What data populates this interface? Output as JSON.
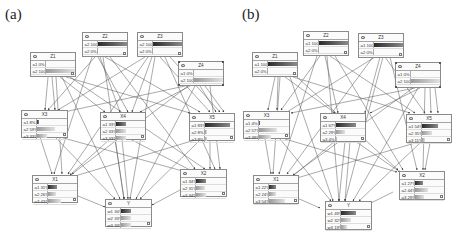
{
  "panels": [
    {
      "label": "(a)",
      "nodes": {
        "Z1": {
          "title": "Z1",
          "states": [
            {
              "label": "a1",
              "value": "0%",
              "pct": 0
            },
            {
              "label": "a2",
              "value": "100%",
              "pct": 100
            }
          ]
        },
        "Z2": {
          "title": "Z2",
          "states": [
            {
              "label": "a2",
              "value": "100%",
              "pct": 100
            },
            {
              "label": "a2",
              "value": "0%",
              "pct": 0
            }
          ]
        },
        "Z3": {
          "title": "Z3",
          "states": [
            {
              "label": "a2",
              "value": "100%",
              "pct": 100
            },
            {
              "label": "a2",
              "value": "0%",
              "pct": 0
            }
          ]
        },
        "Z4": {
          "title": "Z4",
          "states": [
            {
              "label": "a1",
              "value": "0%",
              "pct": 0
            },
            {
              "label": "a2",
              "value": "100%",
              "pct": 100
            }
          ]
        },
        "X3": {
          "title": "X3",
          "states": [
            {
              "label": "a1",
              "value": "8%",
              "pct": 8
            },
            {
              "label": "a2",
              "value": "59%",
              "pct": 59
            },
            {
              "label": "a3",
              "value": "33%",
              "pct": 33
            }
          ]
        },
        "X4": {
          "title": "X4",
          "states": [
            {
              "label": "a1",
              "value": "33%",
              "pct": 33
            },
            {
              "label": "a2",
              "value": "33%",
              "pct": 33
            },
            {
              "label": "a3",
              "value": "33%",
              "pct": 33
            }
          ]
        },
        "X5": {
          "title": "X5",
          "states": [
            {
              "label": "a1",
              "value": "83%",
              "pct": 83
            },
            {
              "label": "a2",
              "value": "8%",
              "pct": 8
            },
            {
              "label": "a3",
              "value": "8%",
              "pct": 8
            }
          ]
        },
        "X1": {
          "title": "X1",
          "states": [
            {
              "label": "a1",
              "value": "31%",
              "pct": 31
            },
            {
              "label": "a2",
              "value": "26%",
              "pct": 26
            },
            {
              "label": "a3",
              "value": "43%",
              "pct": 43
            }
          ]
        },
        "X2": {
          "title": "X2",
          "states": [
            {
              "label": "a1",
              "value": "34%",
              "pct": 34
            },
            {
              "label": "a2",
              "value": "31%",
              "pct": 31
            },
            {
              "label": "a3",
              "value": "34%",
              "pct": 34
            }
          ]
        },
        "Y": {
          "title": "Y",
          "states": [
            {
              "label": "w1",
              "value": "34%",
              "pct": 34
            },
            {
              "label": "w2",
              "value": "33%",
              "pct": 33
            },
            {
              "label": "w3",
              "value": "33%",
              "pct": 33
            }
          ]
        }
      }
    },
    {
      "label": "(b)",
      "nodes": {
        "Z1": {
          "title": "Z1",
          "states": [
            {
              "label": "a1",
              "value": "100%",
              "pct": 100
            },
            {
              "label": "a2",
              "value": "0%",
              "pct": 0
            }
          ]
        },
        "Z2": {
          "title": "Z2",
          "states": [
            {
              "label": "a1",
              "value": "100%",
              "pct": 100
            },
            {
              "label": "a2",
              "value": "0%",
              "pct": 0
            }
          ]
        },
        "Z3": {
          "title": "Z3",
          "states": [
            {
              "label": "a1",
              "value": "100%",
              "pct": 100
            },
            {
              "label": "a2",
              "value": "0%",
              "pct": 0
            }
          ]
        },
        "Z4": {
          "title": "Z4",
          "states": [
            {
              "label": "a1",
              "value": "0%",
              "pct": 0
            },
            {
              "label": "a2",
              "value": "100%",
              "pct": 100
            }
          ]
        },
        "X3": {
          "title": "X3",
          "states": [
            {
              "label": "a1",
              "value": "4%",
              "pct": 4
            },
            {
              "label": "a2",
              "value": "57%",
              "pct": 57
            },
            {
              "label": "a3",
              "value": "39%",
              "pct": 39
            }
          ]
        },
        "X4": {
          "title": "X4",
          "states": [
            {
              "label": "a1",
              "value": "67%",
              "pct": 67
            },
            {
              "label": "a2",
              "value": "29%",
              "pct": 29
            },
            {
              "label": "a3",
              "value": "4%",
              "pct": 4
            }
          ]
        },
        "X5": {
          "title": "X5",
          "states": [
            {
              "label": "a1",
              "value": "54%",
              "pct": 54
            },
            {
              "label": "a2",
              "value": "35%",
              "pct": 35
            },
            {
              "label": "a3",
              "value": "11%",
              "pct": 11
            }
          ]
        },
        "X1": {
          "title": "X1",
          "states": [
            {
              "label": "a1",
              "value": "22%",
              "pct": 22
            },
            {
              "label": "a2",
              "value": "24%",
              "pct": 24
            },
            {
              "label": "a3",
              "value": "54%",
              "pct": 54
            }
          ]
        },
        "X2": {
          "title": "X2",
          "states": [
            {
              "label": "a1",
              "value": "27%",
              "pct": 27
            },
            {
              "label": "a2",
              "value": "44%",
              "pct": 44
            },
            {
              "label": "a3",
              "value": "29%",
              "pct": 29
            }
          ]
        },
        "Y": {
          "title": "Y",
          "states": [
            {
              "label": "w1",
              "value": "49%",
              "pct": 49
            },
            {
              "label": "w2",
              "value": "32%",
              "pct": 32
            },
            {
              "label": "w3",
              "value": "19%",
              "pct": 19
            }
          ]
        }
      }
    }
  ],
  "colors": {
    "edge": "#555555",
    "border": "#8a8a8a",
    "bar_dark": "#2a2a2a",
    "bar_light": "#c8c8c8"
  }
}
